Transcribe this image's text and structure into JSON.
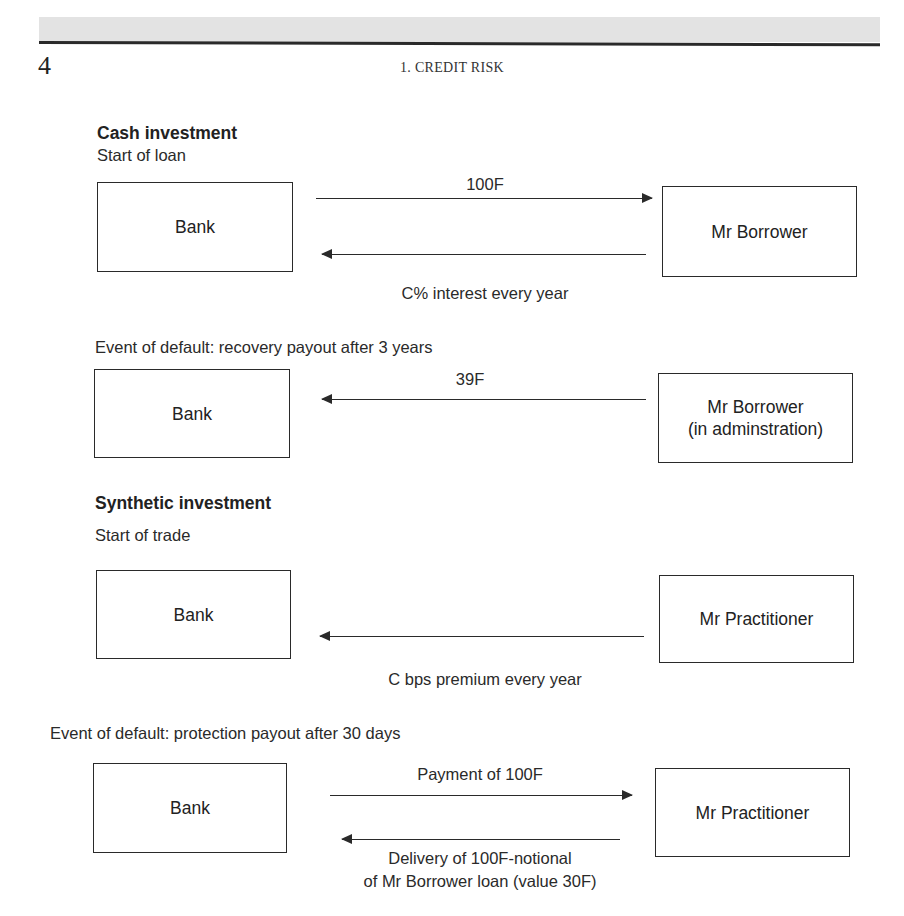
{
  "header": {
    "page_number": "4",
    "running_head": "1. CREDIT RISK"
  },
  "cash": {
    "title": "Cash investment",
    "start": {
      "caption": "Start of loan",
      "left_box": "Bank",
      "right_box": "Mr Borrower",
      "flow_right_label": "100F",
      "flow_left_label": "C% interest every year"
    },
    "default": {
      "caption": "Event of default: recovery payout after 3 years",
      "left_box": "Bank",
      "right_box_line1": "Mr Borrower",
      "right_box_line2": "(in adminstration)",
      "flow_left_label": "39F"
    }
  },
  "synthetic": {
    "title": "Synthetic investment",
    "start": {
      "caption": "Start of trade",
      "left_box": "Bank",
      "right_box": "Mr Practitioner",
      "flow_left_label": "C bps premium every year"
    },
    "default": {
      "caption": "Event of default: protection payout after 30 days",
      "left_box": "Bank",
      "right_box": "Mr Practitioner",
      "flow_right_label": "Payment of 100F",
      "flow_left_label_line1": "Delivery of 100F-notional",
      "flow_left_label_line2": "of Mr Borrower loan (value 30F)"
    }
  }
}
